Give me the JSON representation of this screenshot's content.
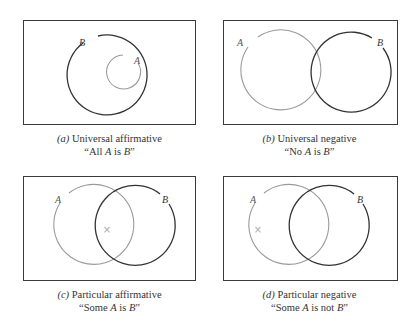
{
  "colors": {
    "frame": "#3a3a3a",
    "circle_A": "#9a9a9a",
    "circle_B": "#333333",
    "mark": "#aaaaaa"
  },
  "panels": [
    {
      "id": "a",
      "label_prefix": "(a)",
      "title": "Universal affirmative",
      "statement_open": "“All ",
      "statement_A": "A",
      "statement_mid": " is ",
      "statement_B": "B",
      "statement_close": "”",
      "circle_labels": {
        "A": "A",
        "B": "B"
      }
    },
    {
      "id": "b",
      "label_prefix": "(b)",
      "title": "Universal negative",
      "statement_open": "“No ",
      "statement_A": "A",
      "statement_mid": " is ",
      "statement_B": "B",
      "statement_close": "”",
      "circle_labels": {
        "A": "A",
        "B": "B"
      }
    },
    {
      "id": "c",
      "label_prefix": "(c)",
      "title": "Particular affirmative",
      "statement_open": "“Some ",
      "statement_A": "A",
      "statement_mid": " is ",
      "statement_B": "B",
      "statement_close": "”",
      "circle_labels": {
        "A": "A",
        "B": "B"
      },
      "mark": "×"
    },
    {
      "id": "d",
      "label_prefix": "(d)",
      "title": "Particular negative",
      "statement_open": "“Some ",
      "statement_A": "A",
      "statement_mid": " is not ",
      "statement_B": "B",
      "statement_close": "”",
      "circle_labels": {
        "A": "A",
        "B": "B"
      },
      "mark": "×"
    }
  ]
}
